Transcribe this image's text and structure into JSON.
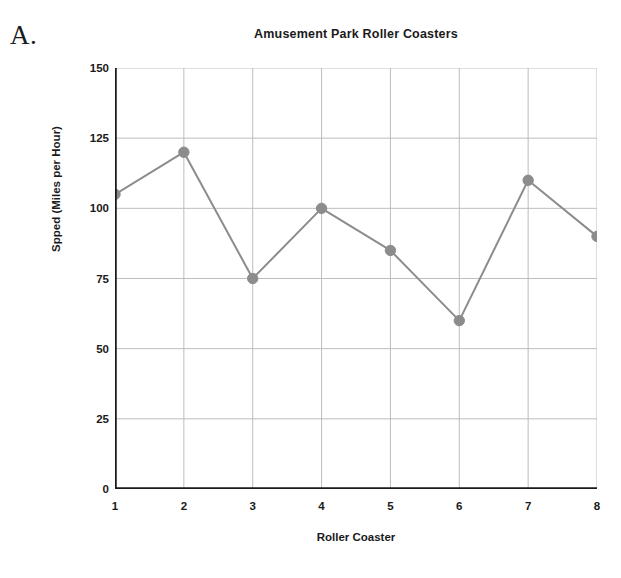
{
  "figure": {
    "label": "A."
  },
  "chart_data": {
    "type": "line",
    "title": "Amusement Park Roller Coasters",
    "xlabel": "Roller Coaster",
    "ylabel": "Spped (Miles per Hour)",
    "categories": [
      "1",
      "2",
      "3",
      "4",
      "5",
      "6",
      "7",
      "8"
    ],
    "values": [
      105,
      120,
      75,
      100,
      85,
      60,
      110,
      90
    ],
    "series": [
      {
        "name": "Speed",
        "values": [
          105,
          120,
          75,
          100,
          85,
          60,
          110,
          90
        ]
      }
    ],
    "xlim": [
      1,
      8
    ],
    "ylim": [
      0,
      150
    ],
    "yticks": [
      0,
      25,
      50,
      75,
      100,
      125,
      150
    ],
    "ytick_labels": [
      "0",
      "25",
      "50",
      "75",
      "100",
      "125",
      "150"
    ],
    "xticks": [
      1,
      2,
      3,
      4,
      5,
      6,
      7,
      8
    ],
    "xtick_labels": [
      "1",
      "2",
      "3",
      "4",
      "5",
      "6",
      "7",
      "8"
    ],
    "grid": "both",
    "legend": "none",
    "marker": "circle",
    "colors": {
      "line": "#8c8c8c",
      "marker": "#8c8c8c",
      "grid": "#bdbdbd",
      "axis": "#1a1a1a",
      "text": "#1a1a1a",
      "background": "#ffffff"
    }
  }
}
